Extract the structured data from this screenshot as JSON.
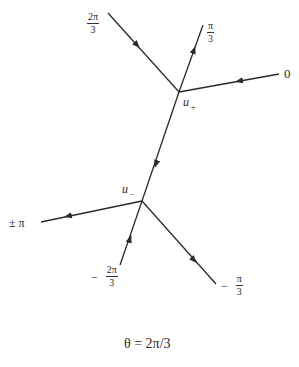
{
  "diagram": {
    "caption": "θ = 2π/3",
    "nodes": {
      "u_plus": {
        "label": "u",
        "subscript": "+",
        "x": 179,
        "y": 92
      },
      "u_minus": {
        "label": "u",
        "subscript": "−",
        "x": 142,
        "y": 201
      }
    },
    "edges": [
      {
        "id": "edge-2pi3",
        "from": [
          108,
          13
        ],
        "to": [
          179,
          92
        ],
        "arrow": "toward u+",
        "label": "2π/3"
      },
      {
        "id": "edge-pi3",
        "from": [
          179,
          92
        ],
        "to": [
          203,
          25
        ],
        "arrow": "away from u+",
        "label": "π/3"
      },
      {
        "id": "edge-0",
        "from": [
          279,
          74
        ],
        "to": [
          179,
          92
        ],
        "arrow": "toward u+",
        "label": "0"
      },
      {
        "id": "edge-connect",
        "from": [
          179,
          92
        ],
        "to": [
          142,
          201
        ],
        "arrow": "toward u−",
        "label": ""
      },
      {
        "id": "edge-pm-pi",
        "from": [
          142,
          201
        ],
        "to": [
          41,
          222
        ],
        "arrow": "away from u−",
        "label": "± π"
      },
      {
        "id": "edge-neg-2pi3",
        "from": [
          120,
          265
        ],
        "to": [
          142,
          201
        ],
        "arrow": "toward u−",
        "label": "−2π/3"
      },
      {
        "id": "edge-neg-pi3",
        "from": [
          142,
          201
        ],
        "to": [
          216,
          284
        ],
        "arrow": "away from u−",
        "label": "−π/3"
      }
    ],
    "labels": {
      "two_pi_3": {
        "num": "2π",
        "den": "3"
      },
      "pi_3": {
        "num": "π",
        "den": "3"
      },
      "zero": "0",
      "pm_pi": "± π",
      "neg_two_pi_3": {
        "sign": "−",
        "num": "2π",
        "den": "3"
      },
      "neg_pi_3": {
        "sign": "−",
        "num": "π",
        "den": "3"
      },
      "u_plus": {
        "base": "u",
        "sub": "+"
      },
      "u_minus": {
        "base": "u",
        "sub": "−"
      }
    },
    "colors": {
      "line": "#2a2a2a",
      "background": "#ffffff"
    }
  }
}
